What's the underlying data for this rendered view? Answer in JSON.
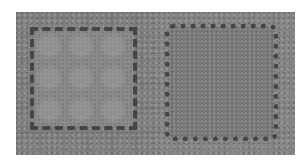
{
  "image": {
    "description": "Two side-by-side grayscale textured micrograph-like panels, each with a jagged dark dotted square outline",
    "background_color": "#ffffff",
    "panels": [
      {
        "id": "left",
        "base_color": "#7c7c7c",
        "inner_color": "#8a8a8a",
        "outline_color": "#3c3c3c",
        "outline_shape": "square"
      },
      {
        "id": "right",
        "base_color": "#828282",
        "inner_color": "#7a7a7a",
        "outline_color": "#3c3c3c",
        "outline_shape": "rounded-square"
      }
    ]
  }
}
